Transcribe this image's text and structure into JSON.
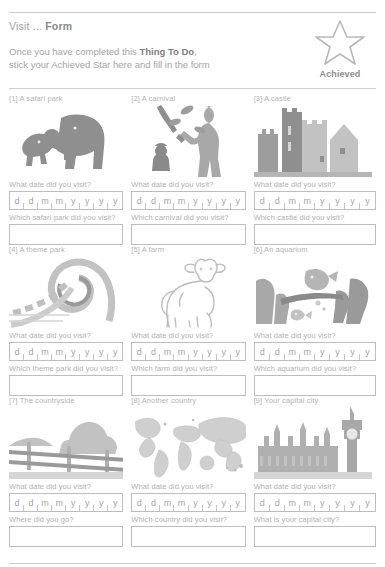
{
  "header": {
    "title_prefix": "Visit ... ",
    "title_bold": "Form",
    "intro_line1_a": "Once you have completed this ",
    "intro_line1_bold": "Thing To Do",
    "intro_line1_b": ",",
    "intro_line2": "stick your Achieved Star here and fill in the form",
    "star_label": "Achieved",
    "star_icon": "star-outline-icon"
  },
  "date_placeholder_chars": [
    "d",
    "d",
    "m",
    "m",
    "y",
    "y",
    "y",
    "y"
  ],
  "cells": [
    {
      "label": "[1] A safari park",
      "art_icon": "elephant-silhouette-icon",
      "date_question": "What date did you visit?",
      "text_question": "Which safari park did you visit?",
      "text_value": ""
    },
    {
      "label": "[2] A carnival",
      "art_icon": "juggler-silhouette-icon",
      "date_question": "What date did you visit?",
      "text_question": "Which carnival did you visit?",
      "text_value": ""
    },
    {
      "label": "[3] A castle",
      "art_icon": "castle-silhouette-icon",
      "date_question": "What date did you visit?",
      "text_question": "Which castle did you visit?",
      "text_value": ""
    },
    {
      "label": "[4] A theme park",
      "art_icon": "rollercoaster-loop-icon",
      "date_question": "What date did you visit?",
      "text_question": "Which theme park did you visit?",
      "text_value": ""
    },
    {
      "label": "[5] A farm",
      "art_icon": "lamb-outline-icon",
      "date_question": "What date did you visit?",
      "text_question": "Which farm did you visit?",
      "text_value": ""
    },
    {
      "label": "[6] An aquarium",
      "art_icon": "underwater-fish-rocks-icon",
      "date_question": "What date did you visit?",
      "text_question": "Which aquarium did you visit?",
      "text_value": ""
    },
    {
      "label": "[7] The countryside",
      "art_icon": "fence-trees-landscape-icon",
      "date_question": "What date did you visit?",
      "text_question": "Where did you go?",
      "text_value": ""
    },
    {
      "label": "[8] Another country",
      "art_icon": "world-map-icon",
      "date_question": "What date did you visit?",
      "text_question": "Which country did you visit?",
      "text_value": ""
    },
    {
      "label": "[9] Your capital city",
      "art_icon": "big-ben-parliament-silhouette-icon",
      "date_question": "What date did you visit?",
      "text_question": "What is your capital city?",
      "text_value": ""
    }
  ],
  "colors": {
    "ink": "#a0a0a0",
    "rule": "#c9c9c9",
    "border": "#bdbdbd",
    "art_dark": "#8f8f8f",
    "art_mid": "#b5b5b5",
    "art_light": "#d5d5d5"
  }
}
